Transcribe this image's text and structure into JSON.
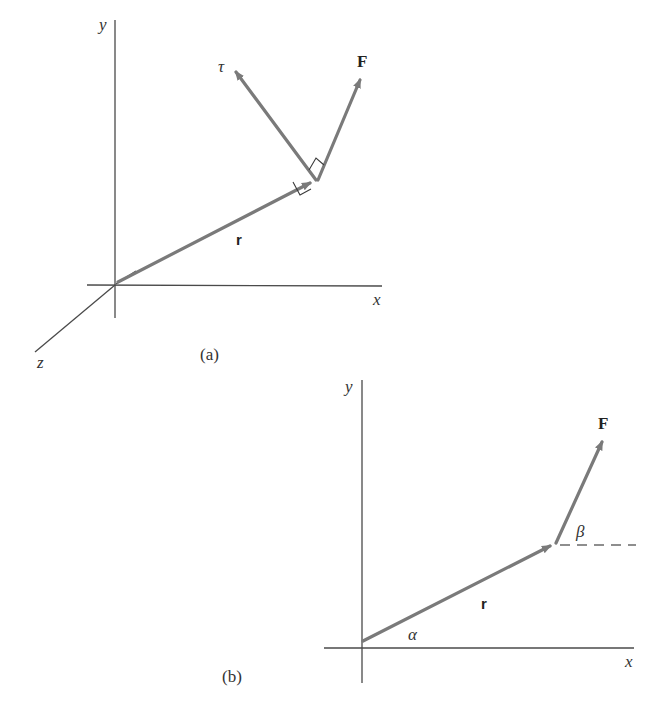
{
  "figure_a": {
    "caption": "(a)",
    "axes": {
      "x_label": "x",
      "y_label": "y",
      "z_label": "z"
    },
    "vectors": {
      "r": {
        "label": "r"
      },
      "F": {
        "label": "F"
      },
      "tau": {
        "label": "τ"
      }
    }
  },
  "figure_b": {
    "caption": "(b)",
    "axes": {
      "x_label": "x",
      "y_label": "y"
    },
    "vectors": {
      "r": {
        "label": "r"
      },
      "F": {
        "label": "F"
      }
    },
    "angles": {
      "alpha": "α",
      "beta": "β"
    }
  },
  "colors": {
    "vector": "#7a7a7a",
    "axis": "#4a4a4a",
    "text": "#333333"
  }
}
